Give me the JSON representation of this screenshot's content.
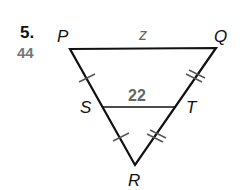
{
  "problem": {
    "number": "5.",
    "secondary_number": "44"
  },
  "diagram": {
    "vertices": {
      "P": "P",
      "Q": "Q",
      "R": "R",
      "S": "S",
      "T": "T"
    },
    "segments": {
      "PQ_label": "z",
      "ST_label": "22"
    },
    "tick_marks": {
      "PS": 1,
      "SR": 1,
      "QT": 2,
      "TR": 2
    },
    "colors": {
      "line": "#111111",
      "measure_text": "#666666"
    }
  }
}
